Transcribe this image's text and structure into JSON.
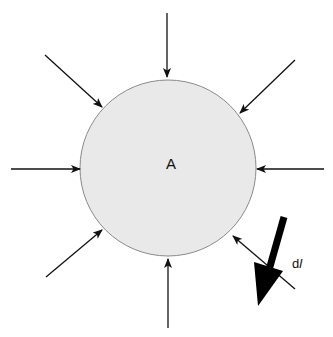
{
  "diagram": {
    "region_label": "A",
    "element_label": "dl",
    "colors": {
      "circle_fill": "#e9e9e9",
      "circle_stroke": "#8a8a8a",
      "arrow": "#111111",
      "background": "#ffffff"
    },
    "inward_arrows": [
      {
        "name": "arrow-top",
        "x1": 167,
        "y1": 13,
        "x2": 167,
        "y2": 77
      },
      {
        "name": "arrow-top-right",
        "x1": 295,
        "y1": 60,
        "x2": 240,
        "y2": 113
      },
      {
        "name": "arrow-right",
        "x1": 324,
        "y1": 169,
        "x2": 257,
        "y2": 169
      },
      {
        "name": "arrow-bottom-right",
        "x1": 295,
        "y1": 289,
        "x2": 233,
        "y2": 236
      },
      {
        "name": "arrow-bottom",
        "x1": 168,
        "y1": 328,
        "x2": 168,
        "y2": 259
      },
      {
        "name": "arrow-bottom-left",
        "x1": 46,
        "y1": 277,
        "x2": 102,
        "y2": 230
      },
      {
        "name": "arrow-left",
        "x1": 11,
        "y1": 169,
        "x2": 80,
        "y2": 169
      },
      {
        "name": "arrow-top-left",
        "x1": 45,
        "y1": 55,
        "x2": 102,
        "y2": 107
      }
    ],
    "big_arrow": {
      "x1": 284,
      "y1": 217,
      "x2": 258,
      "y2": 306
    }
  }
}
